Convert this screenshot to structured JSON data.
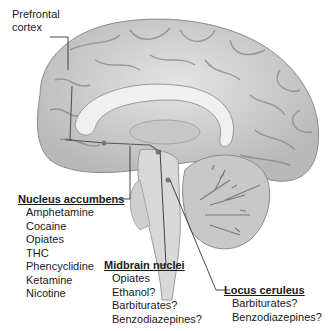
{
  "diagram": {
    "type": "anatomical-brain-sagittal",
    "colors": {
      "brain_fill": "#d4d4d4",
      "brain_shadow": "#9a9a9a",
      "gyri_line": "#8c8c8c",
      "leader_line": "#333333",
      "text": "#1a1a1a"
    },
    "labels": {
      "prefrontal": {
        "line1": "Prefrontal",
        "line2": "cortex"
      },
      "nucleus_accumbens": {
        "title": "Nucleus accumbens",
        "items": [
          "Amphetamine",
          "Cocaine",
          "Opiates",
          "THC",
          "Phencyclidine",
          "Ketamine",
          "Nicotine"
        ]
      },
      "midbrain_nuclei": {
        "title": "Midbrain nuclei",
        "items": [
          "Opiates",
          "Ethanol?",
          "Barbiturates?",
          "Benzodiazepines?"
        ]
      },
      "locus_ceruleus": {
        "title": "Locus ceruleus",
        "items": [
          "Barbiturates?",
          "Benzodiazepines?"
        ]
      }
    }
  }
}
